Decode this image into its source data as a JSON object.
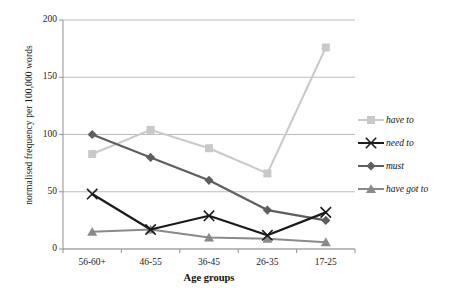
{
  "chart_data": {
    "type": "line",
    "title": "",
    "xlabel": "Age groups",
    "ylabel": "normalised frequency per 100,000 words",
    "categories": [
      "56-60+",
      "46-55",
      "36-45",
      "26-35",
      "17-25"
    ],
    "ylim": [
      0,
      200
    ],
    "yticks": [
      0,
      50,
      100,
      150,
      200
    ],
    "grid": true,
    "legend_position": "right",
    "series": [
      {
        "name": "have to",
        "color": "#c9c9c9",
        "marker": "square",
        "values": [
          83,
          104,
          88,
          66,
          176
        ]
      },
      {
        "name": "need to",
        "color": "#1a1a1a",
        "marker": "x",
        "values": [
          48,
          17,
          29,
          12,
          32
        ]
      },
      {
        "name": "must",
        "color": "#5e5e5e",
        "marker": "diamond",
        "values": [
          100,
          80,
          60,
          34,
          25
        ]
      },
      {
        "name": "have got to",
        "color": "#8a8a8a",
        "marker": "triangle",
        "values": [
          15,
          17,
          10,
          9,
          6
        ]
      }
    ]
  },
  "axis": {
    "y_tick_labels": [
      "200",
      "150",
      "100",
      "50",
      "0"
    ],
    "x_tick_labels": [
      "56-60+",
      "46-55",
      "36-45",
      "26-35",
      "17-25"
    ]
  },
  "legend": {
    "items": [
      {
        "label": "have to"
      },
      {
        "label": "need to"
      },
      {
        "label": "must"
      },
      {
        "label": "have got to"
      }
    ]
  },
  "style": {
    "axis_color": "#9a9a9a",
    "grid_color": "#b4b4b4",
    "plot_background": "#ffffff"
  }
}
